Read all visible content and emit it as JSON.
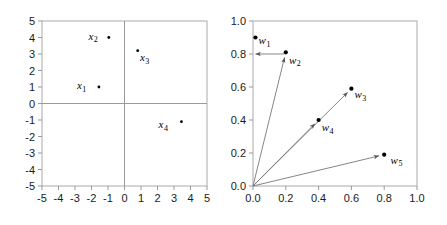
{
  "figure": {
    "background": "#ffffff",
    "axis_color": "#999999",
    "frame_color": "#aaaaaa",
    "vector_color": "#777777",
    "marker_color": "#000000"
  },
  "chart_data": [
    {
      "type": "scatter",
      "id": "left-panel",
      "title": "",
      "xlabel": "",
      "ylabel": "",
      "xlim": [
        -5,
        5
      ],
      "ylim": [
        -5,
        5
      ],
      "grid": false,
      "axes_style": "crosshair-at-origin-with-box-frame",
      "xticks": [
        -5,
        -4,
        -3,
        -2,
        -1,
        0,
        1,
        2,
        3,
        4,
        5
      ],
      "xtick_labels": [
        "-5",
        "-4",
        "-3",
        "-2",
        "-1",
        "0",
        "1",
        "2",
        "3",
        "4",
        "5"
      ],
      "yticks": [
        -5,
        -4,
        -3,
        -2,
        -1,
        0,
        1,
        2,
        3,
        4,
        5
      ],
      "ytick_labels": [
        "-5",
        "-4",
        "-3",
        "-2",
        "-1",
        "0",
        "1",
        "2",
        "3",
        "4",
        "5"
      ],
      "points": [
        {
          "name": "x",
          "sub": "1",
          "label": "x_1",
          "x": -1.55,
          "y": 1.0,
          "label_dx": -1.05,
          "label_dy": 0.12,
          "marker": "small"
        },
        {
          "name": "x",
          "sub": "2",
          "label": "x_2",
          "x": -0.95,
          "y": 4.0,
          "label_dx": -0.95,
          "label_dy": 0.1,
          "marker": "small"
        },
        {
          "name": "x",
          "sub": "3",
          "label": "x_3",
          "x": 0.8,
          "y": 3.2,
          "label_dx": 0.42,
          "label_dy": -0.38,
          "marker": "small"
        },
        {
          "name": "x",
          "sub": "4",
          "label": "x_4",
          "x": 3.45,
          "y": -1.1,
          "label_dx": -1.1,
          "label_dy": -0.15,
          "marker": "small"
        }
      ]
    },
    {
      "type": "scatter",
      "id": "right-panel",
      "title": "",
      "xlabel": "",
      "ylabel": "",
      "xlim": [
        0.0,
        1.0
      ],
      "ylim": [
        0.0,
        1.0
      ],
      "grid": false,
      "axes_style": "box-frame-ticks-outside",
      "xticks": [
        0.0,
        0.2,
        0.4,
        0.6,
        0.8,
        1.0
      ],
      "xtick_labels": [
        "0.0",
        "0.2",
        "0.4",
        "0.6",
        "0.8",
        "1.0"
      ],
      "yticks": [
        0.0,
        0.2,
        0.4,
        0.6,
        0.8,
        1.0
      ],
      "ytick_labels": [
        "0.0",
        "0.2",
        "0.4",
        "0.6",
        "0.8",
        "1.0"
      ],
      "vectors_origin": [
        0.0,
        0.0
      ],
      "points": [
        {
          "name": "w",
          "sub": "1",
          "label": "w_1",
          "x": 0.015,
          "y": 0.9,
          "label_dx": 0.055,
          "label_dy": -0.015,
          "marker": "big",
          "has_vector": false
        },
        {
          "name": "w",
          "sub": "2",
          "label": "w_2",
          "x": 0.2,
          "y": 0.81,
          "label_dx": 0.055,
          "label_dy": -0.045,
          "marker": "big",
          "has_vector": true
        },
        {
          "name": "w",
          "sub": "3",
          "label": "w_3",
          "x": 0.6,
          "y": 0.59,
          "label_dx": 0.055,
          "label_dy": -0.035,
          "marker": "big",
          "has_vector": true
        },
        {
          "name": "w",
          "sub": "4",
          "label": "w_4",
          "x": 0.4,
          "y": 0.4,
          "label_dx": 0.055,
          "label_dy": -0.045,
          "marker": "big",
          "has_vector": true
        },
        {
          "name": "w",
          "sub": "5",
          "label": "w_5",
          "x": 0.8,
          "y": 0.19,
          "label_dx": 0.075,
          "label_dy": -0.03,
          "marker": "big",
          "has_vector": true
        }
      ],
      "annotations": [
        {
          "kind": "horizontal-arrow",
          "from": [
            0.19,
            0.8
          ],
          "to": [
            0.015,
            0.8
          ],
          "note": "arrow from w2 level back to y-axis at 0.8"
        }
      ]
    }
  ]
}
